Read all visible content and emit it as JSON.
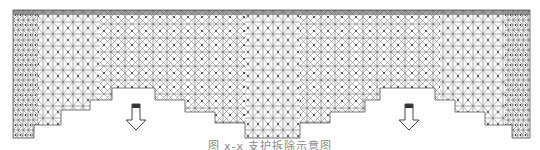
{
  "figure": {
    "type": "space-frame lattice structure, stepped bottom outline, two downward arrows",
    "colors": {
      "background": "#ffffff",
      "lattice_line": "#555555",
      "node": "#333333",
      "arrow": "#444444"
    },
    "outline_points": "13,10 530,10 530,138 512,138 512,125 485,125 485,112 455,112 455,100 435,100 435,88 380,88 380,100 365,100 365,112 330,112 330,123 300,123 300,138 245,138 245,123 215,123 215,112 185,112 185,100 155,100 155,88 112,88 112,100 90,100 90,110 61,110 61,125 34,125 34,138 13,138",
    "arrows": [
      {
        "name": "left-down-arrow",
        "x": 136
      },
      {
        "name": "right-down-arrow",
        "x": 409
      }
    ]
  },
  "caption": {
    "text": "图 x-x  支护拆除示意图"
  }
}
